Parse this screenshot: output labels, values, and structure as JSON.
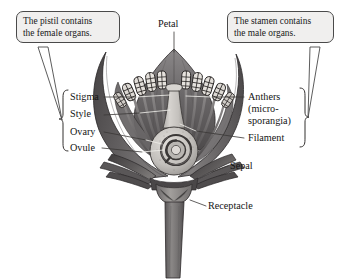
{
  "diagram": {
    "style": "grayscale engraving",
    "background_color": "#ffffff"
  },
  "callouts": [
    {
      "id": "pistil",
      "text": "The pistil contains\nthe female organs.",
      "fill": "#f0efee",
      "stroke": "#4a4a4a"
    },
    {
      "id": "stamen",
      "text": "The stamen contains\nthe male organs.",
      "fill": "#f0efee",
      "stroke": "#4a4a4a"
    }
  ],
  "labels": {
    "petal": "Petal",
    "stigma": "Stigma",
    "style": "Style",
    "ovary": "Ovary",
    "ovule": "Ovule",
    "anthers": "Anthers\n(micro-\nsporangia)",
    "filament": "Filament",
    "sepal": "Sepal",
    "receptacle": "Receptacle"
  },
  "label_groups": {
    "pistil_parts": [
      "Stigma",
      "Style",
      "Ovary",
      "Ovule"
    ],
    "stamen_parts": [
      "Anthers (microsporangia)",
      "Filament"
    ]
  },
  "colors": {
    "petal_dark": "#555253",
    "petal_mid": "#6e6b6c",
    "petal_light": "#8d8a8a",
    "pistil_light": "#c9c6c3",
    "stem": "#7b7877",
    "outline": "#2b2b2b",
    "leader_line": "#3a3a3a",
    "leader_line_on_art": "#eceae7",
    "text": "#141414"
  }
}
